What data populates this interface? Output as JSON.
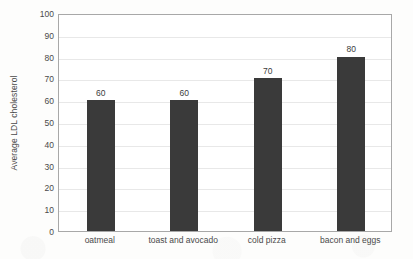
{
  "chart_data": {
    "type": "bar",
    "title": "",
    "subtitle": "",
    "xlabel": "",
    "ylabel": "Average LDL cholesterol",
    "categories": [
      "oatmeal",
      "toast and avocado",
      "cold pizza",
      "bacon and eggs"
    ],
    "values": [
      60,
      60,
      70,
      80
    ],
    "data_labels": [
      "60",
      "60",
      "70",
      "80"
    ],
    "ylim": [
      0,
      100
    ],
    "ytick_step": 10,
    "yticks": [
      100,
      90,
      80,
      70,
      60,
      50,
      40,
      30,
      20,
      10,
      0
    ],
    "ytick_labels": [
      "100",
      "90",
      "80",
      "70",
      "60",
      "50",
      "40",
      "30",
      "20",
      "10",
      "0"
    ],
    "grid": true,
    "grid_axis": "y",
    "legend": false,
    "legend_position": "none",
    "orientation": "vertical",
    "series": [
      {
        "name": "Average LDL cholesterol",
        "values": [
          60,
          60,
          70,
          80
        ]
      }
    ]
  },
  "style": {
    "bar_color": "#3a3a3a",
    "gridline_color": "#e8e8e8",
    "axis_color": "#a8a8a8",
    "text_color": "#4a4a4a",
    "plot_background": "#ffffff",
    "page_background": "#fdfdfc"
  }
}
